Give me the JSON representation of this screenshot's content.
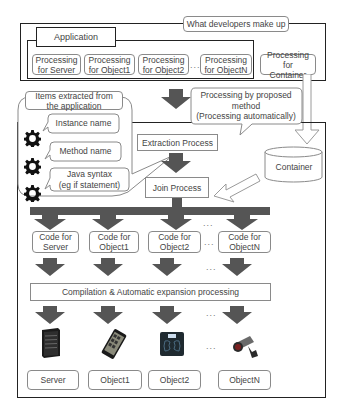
{
  "developers_section": {
    "label": "What developers make up",
    "application": {
      "title": "Application",
      "processing_items": [
        {
          "label": "Processing\nfor Server"
        },
        {
          "label": "Processing\nfor Object1"
        },
        {
          "label": "Processing\nfor Object2"
        },
        {
          "label": "Processing\nfor ObjectN"
        }
      ],
      "ellipsis": "..."
    },
    "container_processing": "Processing for\nContainer"
  },
  "proposed_method_callout": "Processing by proposed\nmethod\n(Processing automatically)",
  "extracted_items": {
    "title": "Items extracted from\nthe application",
    "items": [
      {
        "label": "Instance name",
        "icon": "gear-icon"
      },
      {
        "label": "Method name",
        "icon": "gear-icon"
      },
      {
        "label": "Java syntax\n(eg if statement)",
        "icon": "gear-icon"
      }
    ]
  },
  "process_steps": {
    "extraction": "Extraction Process",
    "join": "Join Process"
  },
  "container": {
    "label": "Container"
  },
  "code_outputs": [
    {
      "label": "Code for\nServer"
    },
    {
      "label": "Code for\nObject1"
    },
    {
      "label": "Code for\nObject2"
    },
    {
      "label": "Code for\nObjectN"
    }
  ],
  "ellipsis": "...",
  "compilation": "Compilation & Automatic expansion processing",
  "targets": [
    {
      "label": "Server",
      "icon": "server-icon"
    },
    {
      "label": "Object1",
      "icon": "smartphone-icon"
    },
    {
      "label": "Object2",
      "icon": "scale-icon"
    },
    {
      "label": "ObjectN",
      "icon": "camera-icon"
    }
  ],
  "colors": {
    "arrow": "#555555",
    "frame": "#222222",
    "box_border": "#8a8a8a"
  }
}
